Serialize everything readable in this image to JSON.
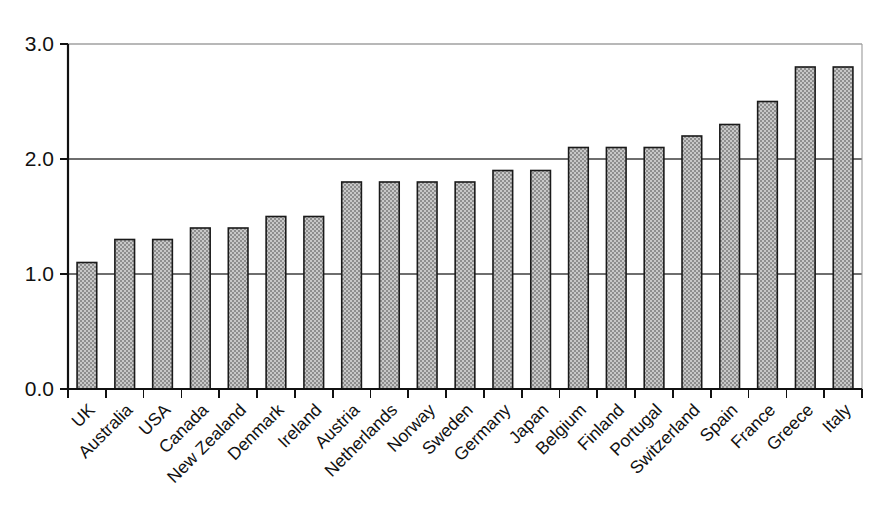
{
  "chart_data": {
    "type": "bar",
    "title": "",
    "subtitle": "",
    "xlabel": "",
    "ylabel": "",
    "categories": [
      "UK",
      "Australia",
      "USA",
      "Canada",
      "New Zealand",
      "Denmark",
      "Ireland",
      "Austria",
      "Netherlands",
      "Norway",
      "Sweden",
      "Germany",
      "Japan",
      "Belgium",
      "Finland",
      "Portugal",
      "Switzerland",
      "Spain",
      "France",
      "Greece",
      "Italy"
    ],
    "values": [
      1.1,
      1.3,
      1.3,
      1.4,
      1.4,
      1.5,
      1.5,
      1.8,
      1.8,
      1.8,
      1.8,
      1.9,
      1.9,
      2.1,
      2.1,
      2.1,
      2.2,
      2.3,
      2.5,
      2.8,
      2.8
    ],
    "ylim": [
      0.0,
      3.0
    ],
    "ytick_labels": [
      "0.0",
      "1.0",
      "2.0",
      "3.0"
    ],
    "ytick_values": [
      0.0,
      1.0,
      2.0,
      3.0
    ],
    "grid": true,
    "grid_axis": "y",
    "legend": false,
    "legend_position": "none",
    "bar_fill_color": "#a8a8a8",
    "bar_edge_color": "#1a1a1a",
    "gridline_color": "#6e6e6e",
    "axis_color": "#111111",
    "background_color": "#ffffff",
    "xtick_label_rotation": 45
  }
}
